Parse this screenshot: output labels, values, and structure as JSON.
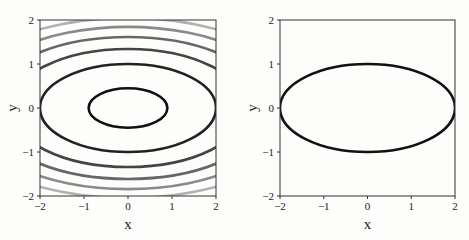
{
  "chart_data": [
    {
      "type": "line",
      "title": "",
      "description": "Contour plot of f(x,y) = x^2/4 + y^2",
      "xlabel": "x",
      "ylabel": "y",
      "xlim": [
        -2,
        2
      ],
      "ylim": [
        -2,
        2
      ],
      "xticks": [
        "-2",
        "-1",
        "0",
        "1",
        "2"
      ],
      "yticks": [
        "-2",
        "-1",
        "0",
        "1",
        "2"
      ],
      "grid": false,
      "contour_levels": [
        0.2,
        1.0,
        1.8,
        2.6,
        3.4,
        4.2
      ],
      "contour_colors": [
        "#111111",
        "#222222",
        "#444444",
        "#666666",
        "#8a8a8a",
        "#b0b0b0"
      ],
      "ellipse_axes": {
        "a_scale": 2,
        "b_scale": 1
      }
    },
    {
      "type": "line",
      "title": "",
      "description": "Level set x^2/4 + y^2 = 1",
      "xlabel": "x",
      "ylabel": "y",
      "xlim": [
        -2,
        2
      ],
      "ylim": [
        -2,
        2
      ],
      "xticks": [
        "-2",
        "-1",
        "0",
        "1",
        "2"
      ],
      "yticks": [
        "-2",
        "-1",
        "0",
        "1",
        "2"
      ],
      "grid": false,
      "contour_levels": [
        1.0
      ],
      "contour_colors": [
        "#111111"
      ],
      "ellipse_axes": {
        "a_scale": 2,
        "b_scale": 1
      }
    }
  ]
}
